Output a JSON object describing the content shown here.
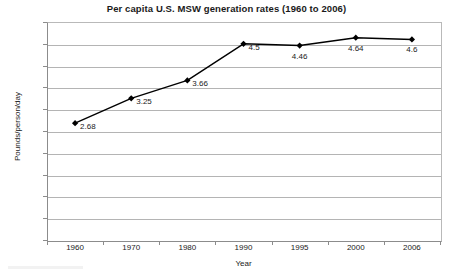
{
  "chart_data": {
    "type": "line",
    "title": "Per capita U.S. MSW generation rates (1960 to 2006)",
    "xlabel": "Year",
    "ylabel": "Pounds/person/day",
    "categories": [
      "1960",
      "1970",
      "1980",
      "1990",
      "1995",
      "2000",
      "2006"
    ],
    "values": [
      2.68,
      3.25,
      3.66,
      4.5,
      4.46,
      4.64,
      4.6
    ],
    "point_labels": [
      "2.68",
      "3.25",
      "3.66",
      "4.5",
      "4.46",
      "4.64",
      "4.6"
    ],
    "ylim": [
      0,
      5
    ],
    "ytick_labels": [
      "5",
      "4.5",
      "4",
      "3.5",
      "3",
      "2.5",
      "2",
      "1.5",
      "1",
      "0.5",
      "0"
    ],
    "ytick_values": [
      5,
      4.5,
      4,
      3.5,
      3,
      2.5,
      2,
      1.5,
      1,
      0.5,
      0
    ],
    "grid": "horizontal",
    "legend": "none",
    "series_color": "#000000",
    "marker": "diamond",
    "gridline_color": "#b4b4b4",
    "background_color": "#ffffff"
  }
}
